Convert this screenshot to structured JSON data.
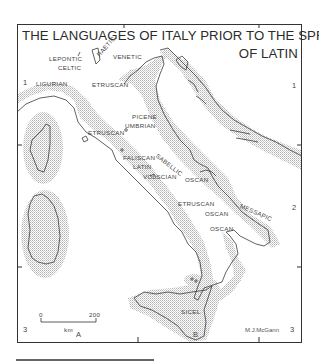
{
  "title": {
    "line1": "THE LANGUAGES OF ITALY PRIOR TO THE SPREAD",
    "line2": "OF LATIN"
  },
  "languages": {
    "lepontic": "LEPONTIC",
    "celtic": "CELTIC",
    "raetic": "RAETIC",
    "venetic": "VENETIC",
    "ligurian": "LIGURIAN",
    "etruscan_north": "ETRUSCAN",
    "picene": "PICENE",
    "umbrian": "UMBRIAN",
    "etruscan_west": "ETRUSCAN",
    "faliscan": "FALISCAN",
    "sabellic": "SABELLIC",
    "latin": "LATIN",
    "volscian": "VOLSCIAN",
    "oscan_central": "OSCAN",
    "etruscan_south": "ETRUSCAN",
    "oscan_south1": "OSCAN",
    "oscan_south2": "OSCAN",
    "messapic": "MESSAPIC",
    "sicel": "SICEL"
  },
  "grid_labels": {
    "left_1": "1",
    "right_1": "1",
    "right_2": "2",
    "left_3": "3",
    "right_3": "3",
    "bottom_a": "A",
    "bottom_b": "B"
  },
  "scale_bar": {
    "start": "0",
    "end": "200",
    "unit": "km"
  },
  "credit": "M.J.McGann",
  "colors": {
    "coast_line": "#3a3a3a",
    "sea_stipple": "#b8b8b8",
    "frame": "#333333"
  }
}
